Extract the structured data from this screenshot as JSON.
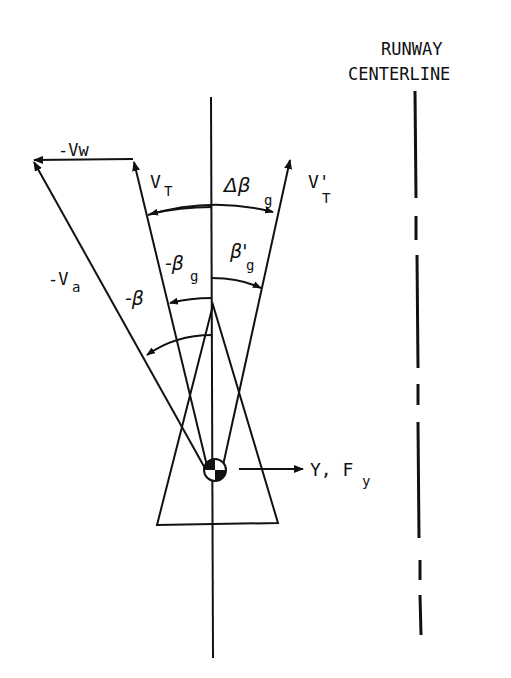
{
  "diagram": {
    "title_runway_line1": "RUNWAY",
    "title_runway_line2": "CENTERLINE",
    "labels": {
      "wind": "-Vw",
      "true_velocity": "V",
      "true_velocity_sub": "T",
      "true_velocity_prime": "V'",
      "true_velocity_prime_sub": "T",
      "air_velocity": "-V",
      "air_velocity_sub": "a",
      "delta_beta": "Δβ",
      "delta_beta_sub": "g",
      "neg_beta_g": "-β",
      "neg_beta_g_sub": "g",
      "beta_g_prime": "β'",
      "beta_g_prime_sub": "g",
      "neg_beta": "-β",
      "side_force": "Y, F",
      "side_force_sub": "y"
    },
    "colors": {
      "ink": "#111111",
      "background": "#ffffff"
    }
  }
}
